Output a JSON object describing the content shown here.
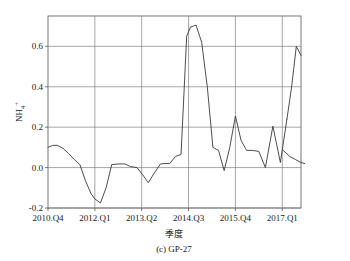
{
  "chart_data": {
    "type": "line",
    "title": "",
    "caption": "(c) GP-27",
    "xlabel": "季度",
    "ylabel": "NH",
    "ylabel_sub": "4",
    "ylabel_sup": "+",
    "xlim": [
      0,
      27
    ],
    "ylim": [
      -0.2,
      0.75
    ],
    "yticks": [
      -0.2,
      0.0,
      0.2,
      0.4,
      0.6
    ],
    "ytick_labels": [
      "-0.2",
      "0.0",
      "0.2",
      "0.4",
      "0.6"
    ],
    "xtick_positions": [
      0,
      5,
      10,
      15,
      20,
      25
    ],
    "xtick_labels": [
      "2010.Q4",
      "2012.Q1",
      "2013.Q2",
      "2014.Q3",
      "2015.Q4",
      "2017.Q1"
    ],
    "grid": true,
    "grid_color": "#808080",
    "line_color": "#3a3a3a",
    "legend": "none",
    "series": [
      {
        "name": "observed",
        "x": [
          0,
          0.5,
          1,
          1.6,
          2.2,
          2.8,
          3.4,
          4.0,
          4.6,
          5.0,
          5.6,
          6.2,
          6.8,
          7.5,
          8.2,
          8.8,
          9.5,
          10.1,
          10.7,
          11.3,
          12.0,
          12.5,
          13.0,
          13.6,
          14.2,
          14.8,
          15.2,
          15.8,
          16.4,
          17.0,
          17.6,
          18.2,
          18.8,
          19.4,
          20.0,
          20.6,
          21.2,
          21.8,
          22.5,
          23.2,
          24.0,
          24.8,
          25.5
        ],
        "values": [
          0.1,
          0.11,
          0.11,
          0.095,
          0.07,
          0.04,
          0.015,
          -0.065,
          -0.13,
          -0.155,
          -0.175,
          -0.1,
          0.015,
          0.018,
          0.018,
          0.005,
          0.0,
          -0.035,
          -0.075,
          -0.03,
          0.018,
          0.02,
          0.02,
          0.055,
          0.065,
          0.65,
          0.695,
          0.705,
          0.62,
          0.4,
          0.1,
          0.085,
          -0.015,
          0.1,
          0.255,
          0.135,
          0.085,
          0.085,
          0.08,
          0.0,
          0.205,
          0.025,
          0.24
        ]
      },
      {
        "name": "observed-tail",
        "x": [
          25.5,
          26.0,
          26.5,
          27.0
        ],
        "values": [
          0.24,
          0.4,
          0.6,
          0.555
        ]
      },
      {
        "name": "forecast",
        "x": [
          25.1,
          25.8,
          26.4,
          27.0,
          27.4
        ],
        "values": [
          0.085,
          0.055,
          0.04,
          0.025,
          0.02
        ]
      }
    ],
    "peak_value": 0.705,
    "min_value": -0.175
  }
}
